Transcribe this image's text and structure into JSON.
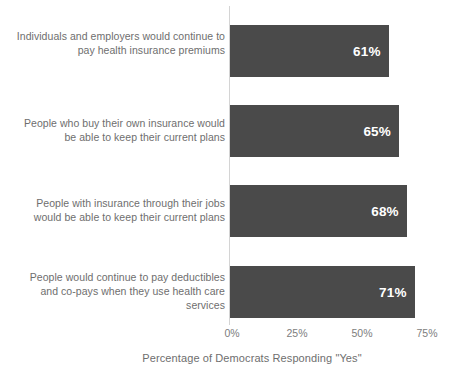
{
  "chart_data": {
    "type": "bar",
    "orientation": "horizontal",
    "title": "",
    "xlabel": "Percentage of Democrats Responding \"Yes\"",
    "ylabel": "",
    "xlim": [
      0,
      75
    ],
    "grid": false,
    "legend": false,
    "bar_color": "#4a4a4a",
    "value_label_color": "#ffffff",
    "categories": [
      "Individuals and employers would continue to pay health insurance premiums",
      "People who buy their own insurance would be able to keep their current plans",
      "People with insurance through their jobs would be able to keep their current plans",
      "People would continue to pay deductibles and co-pays when they use health care services"
    ],
    "values": [
      61,
      65,
      68,
      71
    ],
    "value_labels": [
      "61%",
      "65%",
      "68%",
      "71%"
    ],
    "xticks": [
      0,
      25,
      50,
      75
    ],
    "xticklabels": [
      "0%",
      "25%",
      "50%",
      "75%"
    ]
  },
  "bars": [
    {
      "label": "Individuals and employers would continue to pay health insurance premiums",
      "value": 61,
      "value_label": "61%"
    },
    {
      "label": "People who buy their own insurance would be able to keep their current plans",
      "value": 65,
      "value_label": "65%"
    },
    {
      "label": "People with insurance through their jobs would be able to keep their current plans",
      "value": 68,
      "value_label": "68%"
    },
    {
      "label": "People would continue to pay deductibles and co-pays when they use health care services",
      "value": 71,
      "value_label": "71%"
    }
  ],
  "ticks": [
    {
      "label": "0%",
      "value": 0
    },
    {
      "label": "25%",
      "value": 25
    },
    {
      "label": "50%",
      "value": 50
    },
    {
      "label": "75%",
      "value": 75
    }
  ],
  "axis_title": "Percentage of Democrats Responding \"Yes\""
}
